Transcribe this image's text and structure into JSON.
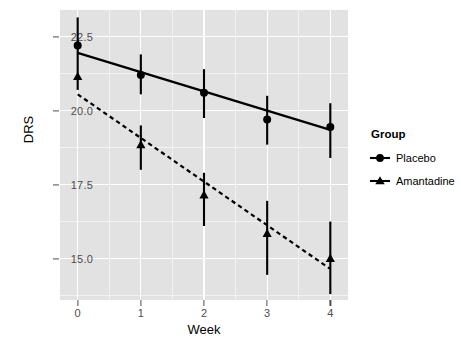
{
  "chart_data": {
    "type": "line",
    "title": "",
    "subtitle": "",
    "xlabel": "Week",
    "ylabel": "DRS",
    "x": [
      0,
      1,
      2,
      3,
      4
    ],
    "xticklabels": [
      "0",
      "1",
      "2",
      "3",
      "4"
    ],
    "yticklabels": [
      "22.5",
      "20.0",
      "17.5",
      "15.0"
    ],
    "yticks": [
      22.5,
      20.0,
      17.5,
      15.0
    ],
    "xlim": [
      -0.28,
      4.28
    ],
    "ylim": [
      13.6,
      23.4
    ],
    "grid": true,
    "legend_position": "right",
    "legend_title": "Group",
    "series": [
      {
        "name": "Placebo",
        "marker": "circle",
        "linestyle": "solid",
        "color": "#000000",
        "values": [
          22.2,
          21.2,
          20.6,
          19.7,
          19.45
        ],
        "fit_start": 21.95,
        "fit_end": 19.35,
        "err_low": [
          22.2,
          20.55,
          19.75,
          18.85,
          18.4
        ],
        "err_high": [
          23.15,
          21.9,
          21.4,
          20.5,
          20.25
        ]
      },
      {
        "name": "Amantadine",
        "marker": "triangle",
        "linestyle": "dashed",
        "color": "#000000",
        "values": [
          21.15,
          18.85,
          17.15,
          15.85,
          15.0
        ],
        "fit_start": 20.55,
        "fit_end": 14.65,
        "err_low": [
          20.7,
          18.0,
          16.1,
          14.45,
          13.8
        ],
        "err_high": [
          22.35,
          19.5,
          17.9,
          16.95,
          16.25
        ]
      }
    ],
    "panel_background": "#e2e2e2",
    "grid_color": "#ffffff",
    "text_color": "#4d4d4d"
  },
  "axis": {
    "x_title": "Week",
    "y_title": "DRS"
  },
  "legend": {
    "title": "Group",
    "items": [
      {
        "label": "Placebo",
        "icon": "circle-marker-icon"
      },
      {
        "label": "Amantadine",
        "icon": "triangle-marker-icon"
      }
    ]
  }
}
